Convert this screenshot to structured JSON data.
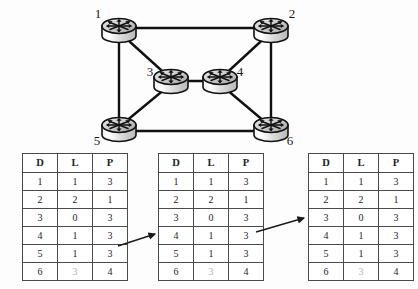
{
  "figure": {
    "background_color": "#fdfdfd",
    "line_color": "#111111",
    "dim_color": "#b2b2b2"
  },
  "topology": {
    "type": "network-graph",
    "node_icon": "router-icon",
    "nodes": [
      {
        "id": "1",
        "label": "1",
        "cx": 119,
        "cy": 28,
        "label_x": 98,
        "label_y": 18
      },
      {
        "id": "2",
        "label": "2",
        "cx": 271,
        "cy": 28,
        "label_x": 292,
        "label_y": 18
      },
      {
        "id": "3",
        "label": "3",
        "cx": 171,
        "cy": 79,
        "label_x": 150,
        "label_y": 76
      },
      {
        "id": "4",
        "label": "4",
        "cx": 220,
        "cy": 79,
        "label_x": 240,
        "label_y": 76
      },
      {
        "id": "5",
        "label": "5",
        "cx": 119,
        "cy": 127,
        "label_x": 97,
        "label_y": 139
      },
      {
        "id": "6",
        "label": "6",
        "cx": 271,
        "cy": 127,
        "label_x": 288,
        "label_y": 139
      }
    ],
    "links": [
      {
        "from": "1",
        "to": "2"
      },
      {
        "from": "1",
        "to": "5"
      },
      {
        "from": "1",
        "to": "3"
      },
      {
        "from": "2",
        "to": "4"
      },
      {
        "from": "2",
        "to": "6"
      },
      {
        "from": "3",
        "to": "4"
      },
      {
        "from": "3",
        "to": "5"
      },
      {
        "from": "4",
        "to": "6"
      },
      {
        "from": "5",
        "to": "6"
      }
    ]
  },
  "tables": {
    "columns": [
      "D",
      "L",
      "P"
    ],
    "instances": [
      {
        "name": "routing-table-1",
        "rows": [
          {
            "cells": [
              "1",
              "1",
              "3"
            ],
            "dim": [
              false,
              false,
              false
            ]
          },
          {
            "cells": [
              "2",
              "2",
              "1"
            ],
            "dim": [
              false,
              false,
              false
            ]
          },
          {
            "cells": [
              "3",
              "0",
              "3"
            ],
            "dim": [
              false,
              false,
              false
            ]
          },
          {
            "cells": [
              "4",
              "1",
              "3"
            ],
            "dim": [
              false,
              false,
              false
            ]
          },
          {
            "cells": [
              "5",
              "1",
              "3"
            ],
            "dim": [
              false,
              false,
              false
            ]
          },
          {
            "cells": [
              "6",
              "3",
              "4"
            ],
            "dim": [
              false,
              true,
              false
            ]
          }
        ]
      },
      {
        "name": "routing-table-2",
        "rows": [
          {
            "cells": [
              "1",
              "1",
              "3"
            ],
            "dim": [
              false,
              false,
              false
            ]
          },
          {
            "cells": [
              "2",
              "2",
              "1"
            ],
            "dim": [
              false,
              false,
              false
            ]
          },
          {
            "cells": [
              "3",
              "0",
              "3"
            ],
            "dim": [
              false,
              false,
              false
            ]
          },
          {
            "cells": [
              "4",
              "1",
              "3"
            ],
            "dim": [
              false,
              false,
              false
            ]
          },
          {
            "cells": [
              "5",
              "1",
              "3"
            ],
            "dim": [
              false,
              false,
              false
            ]
          },
          {
            "cells": [
              "6",
              "3",
              "4"
            ],
            "dim": [
              false,
              true,
              false
            ]
          }
        ]
      },
      {
        "name": "routing-table-3",
        "rows": [
          {
            "cells": [
              "1",
              "1",
              "3"
            ],
            "dim": [
              false,
              false,
              false
            ]
          },
          {
            "cells": [
              "2",
              "2",
              "1"
            ],
            "dim": [
              false,
              false,
              false
            ]
          },
          {
            "cells": [
              "3",
              "0",
              "3"
            ],
            "dim": [
              false,
              false,
              false
            ]
          },
          {
            "cells": [
              "4",
              "1",
              "3"
            ],
            "dim": [
              false,
              false,
              false
            ]
          },
          {
            "cells": [
              "5",
              "1",
              "3"
            ],
            "dim": [
              false,
              false,
              false
            ]
          },
          {
            "cells": [
              "6",
              "3",
              "4"
            ],
            "dim": [
              false,
              true,
              false
            ]
          }
        ]
      }
    ]
  },
  "arrows": [
    {
      "name": "arrow-table1-to-table2",
      "x1": 118,
      "y1": 246,
      "x2": 156,
      "y2": 234
    },
    {
      "name": "arrow-table2-to-table3",
      "x1": 256,
      "y1": 232,
      "x2": 305,
      "y2": 218
    }
  ]
}
